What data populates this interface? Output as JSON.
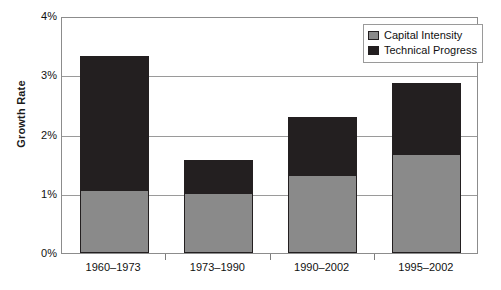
{
  "chart_data": {
    "type": "bar",
    "subtype": "stacked-bar",
    "title": "",
    "xlabel": "",
    "ylabel": "Growth Rate",
    "categories": [
      "1960–1973",
      "1973–1990",
      "1990–2002",
      "1995–2002"
    ],
    "series": [
      {
        "name": "Capital Intensity",
        "color": "#8a8a8a",
        "values": [
          1.05,
          1.0,
          1.3,
          1.65
        ]
      },
      {
        "name": "Technical Progress",
        "color": "#231f20",
        "values": [
          2.25,
          0.55,
          0.98,
          1.2
        ]
      }
    ],
    "totals": [
      3.3,
      1.55,
      2.28,
      2.85
    ],
    "ylim": [
      0,
      4
    ],
    "yticks": [
      0,
      1,
      2,
      3,
      4
    ],
    "ytick_labels": [
      "0%",
      "1%",
      "2%",
      "3%",
      "4%"
    ],
    "grid": true,
    "legend_position": "top-right",
    "value_unit": "%"
  },
  "legend": {
    "items": [
      {
        "label": "Capital Intensity"
      },
      {
        "label": "Technical Progress"
      }
    ]
  }
}
